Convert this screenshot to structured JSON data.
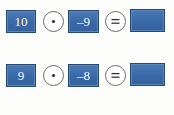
{
  "figure": {
    "colors": {
      "box_blue": "#3f6fae",
      "box_blue_border": "#27496f",
      "box_grey": "#cfcfcf",
      "box_grey_border": "#8a8a8a",
      "text_white": "#ffffff",
      "circle_stroke": "#6b6b6b",
      "background": "#ffffff"
    },
    "operators": {
      "dot": {
        "label": "⊙",
        "name": "circled-dot-operator"
      },
      "equals": {
        "label": "⊜",
        "name": "circled-equals-operator"
      }
    },
    "rows": [
      {
        "state": "active",
        "operand_a": "10",
        "operator_1": "⊙",
        "operand_b": "–9",
        "operator_2": "⊜",
        "result": ""
      },
      {
        "state": "active",
        "operand_a": "9",
        "operator_1": "⊙",
        "operand_b": "–8",
        "operator_2": "⊜",
        "result": ""
      },
      {
        "state": "active",
        "operand_a": "8",
        "operator_1": "⊙",
        "operand_b": "–7",
        "operator_2": "⊜",
        "result": ""
      },
      {
        "state": "inactive",
        "operand_a": "",
        "operator_1": "⊙",
        "operand_b": "",
        "operator_2": "⊜",
        "result": ""
      }
    ]
  }
}
